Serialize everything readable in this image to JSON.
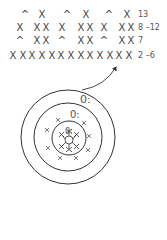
{
  "chart_rows": [
    {
      "label": "13",
      "y": 10,
      "symbols": [
        {
          "g": "^",
          "x": 20
        },
        {
          "g": "X",
          "x": 37
        },
        {
          "g": "^",
          "x": 62
        },
        {
          "g": "X",
          "x": 81
        },
        {
          "g": "^",
          "x": 104
        },
        {
          "g": "X",
          "x": 122
        }
      ]
    },
    {
      "label": "8 –12",
      "y": 23,
      "symbols": [
        {
          "g": "X",
          "x": 15
        },
        {
          "g": "X",
          "x": 32
        },
        {
          "g": "X",
          "x": 41
        },
        {
          "g": "X",
          "x": 57
        },
        {
          "g": "X",
          "x": 76
        },
        {
          "g": "X",
          "x": 85
        },
        {
          "g": "X",
          "x": 99
        },
        {
          "g": "X",
          "x": 117
        },
        {
          "g": "X",
          "x": 126
        }
      ]
    },
    {
      "label": "7",
      "y": 36,
      "symbols": [
        {
          "g": "^",
          "x": 15
        },
        {
          "g": "X",
          "x": 32
        },
        {
          "g": "X",
          "x": 41
        },
        {
          "g": "^",
          "x": 57
        },
        {
          "g": "X",
          "x": 76
        },
        {
          "g": "X",
          "x": 85
        },
        {
          "g": "^",
          "x": 99
        },
        {
          "g": "X",
          "x": 117
        },
        {
          "g": "X",
          "x": 126
        }
      ]
    },
    {
      "label": "2 –6",
      "y": 51,
      "symbols": [
        {
          "g": "X",
          "x": 8
        },
        {
          "g": "X",
          "x": 18
        },
        {
          "g": "X",
          "x": 27
        },
        {
          "g": "X",
          "x": 37
        },
        {
          "g": "X",
          "x": 47
        },
        {
          "g": "X",
          "x": 56
        },
        {
          "g": "X",
          "x": 66
        },
        {
          "g": "X",
          "x": 76
        },
        {
          "g": "X",
          "x": 85
        },
        {
          "g": "X",
          "x": 95
        },
        {
          "g": "X",
          "x": 105
        },
        {
          "g": "X",
          "x": 114
        },
        {
          "g": "X",
          "x": 124
        }
      ]
    }
  ],
  "round_labels": {
    "outer": "0:",
    "middle": "0:",
    "inner": "0:"
  },
  "colors": {
    "ink": "#3a3a3a",
    "light": "#999999"
  }
}
